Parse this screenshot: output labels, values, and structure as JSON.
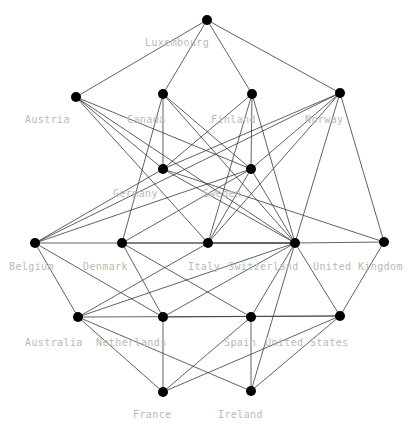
{
  "graph": {
    "title": "Country Network Graph",
    "layout": "layered",
    "canvas": {
      "width": 420,
      "height": 427
    },
    "style": {
      "background": "#ffffff",
      "node_color": "#000000",
      "node_radius": 5,
      "edge_color": "#3a3a3a",
      "edge_width": 0.8,
      "label_color": "#b9b9b9",
      "label_font_size": 10
    },
    "nodes": [
      {
        "id": "luxembourg",
        "label": "Luxembourg",
        "x": 207,
        "y": 20,
        "label_x": 145,
        "label_y": 43,
        "layer": 0
      },
      {
        "id": "austria",
        "label": "Austria",
        "x": 76,
        "y": 97,
        "label_x": 25,
        "label_y": 120,
        "layer": 1
      },
      {
        "id": "canada",
        "label": "Canada",
        "x": 163,
        "y": 94,
        "label_x": 127,
        "label_y": 120,
        "layer": 1
      },
      {
        "id": "finland",
        "label": "Finland",
        "x": 252,
        "y": 94,
        "label_x": 211,
        "label_y": 120,
        "layer": 1
      },
      {
        "id": "norway",
        "label": "Norway",
        "x": 340,
        "y": 93,
        "label_x": 305,
        "label_y": 120,
        "layer": 1
      },
      {
        "id": "germany",
        "label": "Germany",
        "x": 163,
        "y": 169,
        "label_x": 113,
        "label_y": 194,
        "layer": 2
      },
      {
        "id": "sweden",
        "label": "Sweden",
        "x": 251,
        "y": 169,
        "label_x": 203,
        "label_y": 194,
        "layer": 2
      },
      {
        "id": "belgium",
        "label": "Belgium",
        "x": 35,
        "y": 243,
        "label_x": 9,
        "label_y": 267,
        "layer": 3
      },
      {
        "id": "denmark",
        "label": "Denmark",
        "x": 122,
        "y": 243,
        "label_x": 83,
        "label_y": 267,
        "layer": 3
      },
      {
        "id": "italy",
        "label": "Italy",
        "x": 208,
        "y": 243,
        "label_x": 188,
        "label_y": 267,
        "layer": 3
      },
      {
        "id": "switzerland",
        "label": "Switzerland",
        "x": 295,
        "y": 243,
        "label_x": 228,
        "label_y": 267,
        "layer": 3
      },
      {
        "id": "united_kingdom",
        "label": "United Kingdom",
        "x": 384,
        "y": 242,
        "label_x": 313,
        "label_y": 267,
        "layer": 3
      },
      {
        "id": "australia",
        "label": "Australia",
        "x": 78,
        "y": 317,
        "label_x": 25,
        "label_y": 343,
        "layer": 4
      },
      {
        "id": "netherlands",
        "label": "Netherlands",
        "x": 163,
        "y": 317,
        "label_x": 96,
        "label_y": 343,
        "layer": 4
      },
      {
        "id": "spain",
        "label": "Spain",
        "x": 251,
        "y": 317,
        "label_x": 224,
        "label_y": 343,
        "layer": 4
      },
      {
        "id": "united_states",
        "label": "United States",
        "x": 340,
        "y": 316,
        "label_x": 265,
        "label_y": 343,
        "layer": 4
      },
      {
        "id": "france",
        "label": "France",
        "x": 163,
        "y": 392,
        "label_x": 133,
        "label_y": 415,
        "layer": 5
      },
      {
        "id": "ireland",
        "label": "Ireland",
        "x": 251,
        "y": 391,
        "label_x": 218,
        "label_y": 415,
        "layer": 5
      }
    ],
    "edges": [
      {
        "source": "luxembourg",
        "target": "austria"
      },
      {
        "source": "luxembourg",
        "target": "canada"
      },
      {
        "source": "luxembourg",
        "target": "finland"
      },
      {
        "source": "luxembourg",
        "target": "norway"
      },
      {
        "source": "austria",
        "target": "germany"
      },
      {
        "source": "austria",
        "target": "sweden"
      },
      {
        "source": "austria",
        "target": "italy"
      },
      {
        "source": "austria",
        "target": "switzerland"
      },
      {
        "source": "canada",
        "target": "germany"
      },
      {
        "source": "canada",
        "target": "sweden"
      },
      {
        "source": "canada",
        "target": "switzerland"
      },
      {
        "source": "canada",
        "target": "denmark"
      },
      {
        "source": "finland",
        "target": "germany"
      },
      {
        "source": "finland",
        "target": "sweden"
      },
      {
        "source": "finland",
        "target": "switzerland"
      },
      {
        "source": "finland",
        "target": "italy"
      },
      {
        "source": "norway",
        "target": "germany"
      },
      {
        "source": "norway",
        "target": "sweden"
      },
      {
        "source": "norway",
        "target": "switzerland"
      },
      {
        "source": "norway",
        "target": "united_kingdom"
      },
      {
        "source": "norway",
        "target": "belgium"
      },
      {
        "source": "norway",
        "target": "italy"
      },
      {
        "source": "germany",
        "target": "belgium"
      },
      {
        "source": "germany",
        "target": "switzerland"
      },
      {
        "source": "germany",
        "target": "united_kingdom"
      },
      {
        "source": "sweden",
        "target": "belgium"
      },
      {
        "source": "sweden",
        "target": "denmark"
      },
      {
        "source": "sweden",
        "target": "switzerland"
      },
      {
        "source": "sweden",
        "target": "italy"
      },
      {
        "source": "belgium",
        "target": "australia"
      },
      {
        "source": "belgium",
        "target": "netherlands"
      },
      {
        "source": "belgium",
        "target": "switzerland"
      },
      {
        "source": "denmark",
        "target": "netherlands"
      },
      {
        "source": "denmark",
        "target": "spain"
      },
      {
        "source": "denmark",
        "target": "switzerland"
      },
      {
        "source": "italy",
        "target": "australia"
      },
      {
        "source": "italy",
        "target": "switzerland"
      },
      {
        "source": "switzerland",
        "target": "australia"
      },
      {
        "source": "switzerland",
        "target": "netherlands"
      },
      {
        "source": "switzerland",
        "target": "spain"
      },
      {
        "source": "switzerland",
        "target": "united_states"
      },
      {
        "source": "switzerland",
        "target": "united_kingdom"
      },
      {
        "source": "switzerland",
        "target": "ireland"
      },
      {
        "source": "united_kingdom",
        "target": "united_states"
      },
      {
        "source": "australia",
        "target": "france"
      },
      {
        "source": "australia",
        "target": "ireland"
      },
      {
        "source": "australia",
        "target": "united_states"
      },
      {
        "source": "netherlands",
        "target": "france"
      },
      {
        "source": "netherlands",
        "target": "united_states"
      },
      {
        "source": "spain",
        "target": "ireland"
      },
      {
        "source": "spain",
        "target": "france"
      },
      {
        "source": "united_states",
        "target": "france"
      },
      {
        "source": "united_states",
        "target": "ireland"
      }
    ]
  }
}
